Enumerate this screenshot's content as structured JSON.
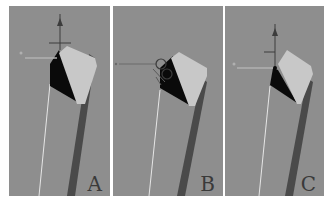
{
  "figure": {
    "background": "#ffffff",
    "viewport_color": "#8e8e8e",
    "panels": [
      {
        "label": "A",
        "gizmo": "move-gizmo-top-corner",
        "x": 9,
        "width": 101
      },
      {
        "label": "B",
        "gizmo": "rotate-gizmo-at-vertex",
        "x": 113,
        "width": 110
      },
      {
        "label": "C",
        "gizmo": "move-gizmo-at-vertex",
        "x": 225,
        "width": 99
      }
    ],
    "colors": {
      "top_face": "#c8c8c8",
      "dark_face": "#0a0a0a",
      "side_face": "#444444",
      "edge_highlight": "#e6e6e6",
      "gizmo": "#3c3c3c"
    }
  }
}
